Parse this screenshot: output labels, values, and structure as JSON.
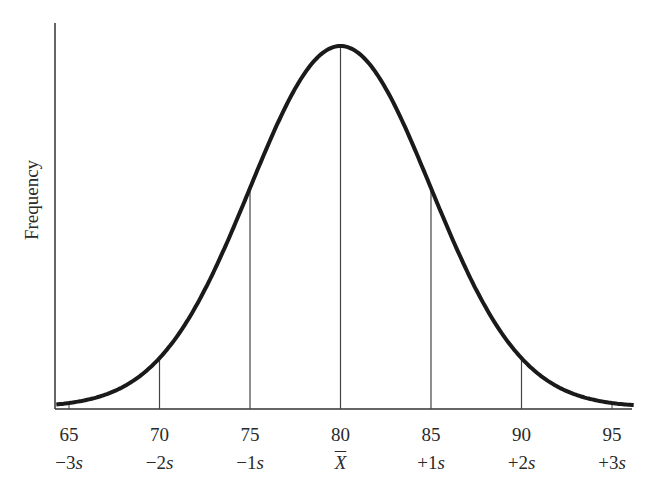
{
  "chart_data": {
    "type": "line",
    "title": "",
    "xlabel": "",
    "ylabel": "Frequency",
    "distribution": "normal",
    "mean": 80,
    "sd": 5,
    "x_ticks": [
      65,
      70,
      75,
      80,
      85,
      90,
      95
    ],
    "x_tick_labels": [
      "65",
      "70",
      "75",
      "80",
      "85",
      "90",
      "95"
    ],
    "sd_labels": [
      "−3s",
      "−2s",
      "−1s",
      "X̄",
      "+1s",
      "+2s",
      "+3s"
    ],
    "sd_marker_lines_at": [
      70,
      75,
      80,
      85,
      90
    ],
    "xlim": [
      64.3,
      96.2
    ],
    "grid": false,
    "legend": null,
    "line_color": "#1a1a1a"
  },
  "axis": {
    "ylabel": "Frequency"
  },
  "ticks": [
    {
      "value": "65",
      "sd": "−3",
      "sd_suffix": "s"
    },
    {
      "value": "70",
      "sd": "−2",
      "sd_suffix": "s"
    },
    {
      "value": "75",
      "sd": "−1",
      "sd_suffix": "s"
    },
    {
      "value": "80",
      "sd": "",
      "sd_suffix": "X"
    },
    {
      "value": "85",
      "sd": "+1",
      "sd_suffix": "s"
    },
    {
      "value": "90",
      "sd": "+2",
      "sd_suffix": "s"
    },
    {
      "value": "95",
      "sd": "+3",
      "sd_suffix": "s"
    }
  ]
}
